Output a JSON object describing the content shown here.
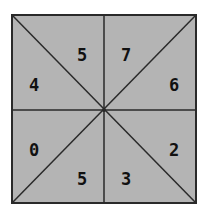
{
  "diagram": {
    "colors": {
      "fill": "#b4b4b4",
      "line": "#2a2a2a",
      "text": "#111111",
      "background": "#ffffff"
    },
    "sectors": [
      {
        "position": "top-left-upper",
        "value": "5"
      },
      {
        "position": "top-right-upper",
        "value": "7"
      },
      {
        "position": "top-right-lower",
        "value": "6"
      },
      {
        "position": "bottom-right-upper",
        "value": "2"
      },
      {
        "position": "bottom-right-lower",
        "value": "3"
      },
      {
        "position": "bottom-left-lower",
        "value": "5"
      },
      {
        "position": "bottom-left-upper",
        "value": "0"
      },
      {
        "position": "top-left-lower",
        "value": "4"
      }
    ]
  }
}
